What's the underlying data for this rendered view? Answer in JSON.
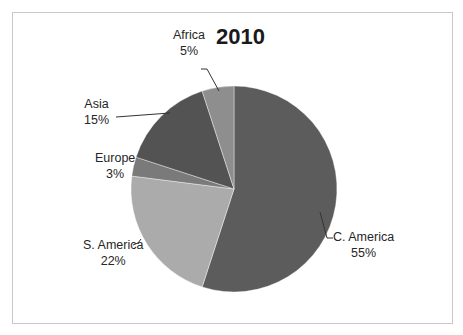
{
  "chart_data": {
    "type": "pie",
    "title": "2010",
    "categories": [
      "C. America",
      "S. America",
      "Europe",
      "Asia",
      "Africa"
    ],
    "values": [
      55,
      22,
      3,
      15,
      5
    ],
    "unit": "%",
    "colors": [
      "#5c5c5c",
      "#ababab",
      "#7a7a7a",
      "#535353",
      "#8e8e8e"
    ],
    "start_angle_deg": 0,
    "direction": "clockwise",
    "legend": "none",
    "data_labels": [
      "C. America\n55%",
      "S. America\n22%",
      "Europe\n3%",
      "Asia\n15%",
      "Africa\n5%"
    ]
  },
  "labels": {
    "c_america": {
      "name": "C. America",
      "pct": "55%"
    },
    "s_america": {
      "name": "S. America",
      "pct": "22%"
    },
    "europe": {
      "name": "Europe",
      "pct": "3%"
    },
    "asia": {
      "name": "Asia",
      "pct": "15%"
    },
    "africa": {
      "name": "Africa",
      "pct": "5%"
    }
  }
}
